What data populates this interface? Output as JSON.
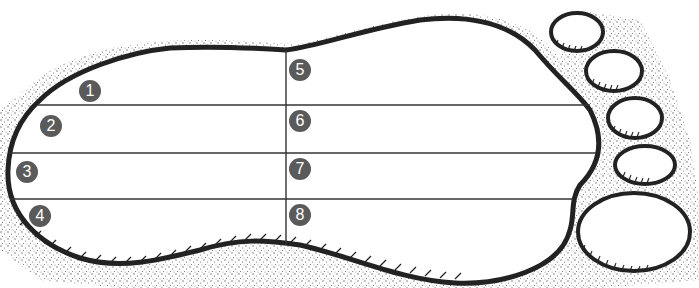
{
  "diagram": {
    "colors": {
      "outline": "#222222",
      "badge": "#5a5a5a",
      "badge_text": "#ffffff",
      "stipple": "#444444",
      "background": "#ffffff"
    },
    "regions": [
      {
        "id": 1,
        "label": "1",
        "x": 79,
        "y": 80
      },
      {
        "id": 2,
        "label": "2",
        "x": 40,
        "y": 115
      },
      {
        "id": 3,
        "label": "3",
        "x": 16,
        "y": 161
      },
      {
        "id": 4,
        "label": "4",
        "x": 29,
        "y": 205
      },
      {
        "id": 5,
        "label": "5",
        "x": 289,
        "y": 59
      },
      {
        "id": 6,
        "label": "6",
        "x": 289,
        "y": 110
      },
      {
        "id": 7,
        "label": "7",
        "x": 289,
        "y": 158
      },
      {
        "id": 8,
        "label": "8",
        "x": 289,
        "y": 204
      }
    ],
    "toes_count": 5
  }
}
